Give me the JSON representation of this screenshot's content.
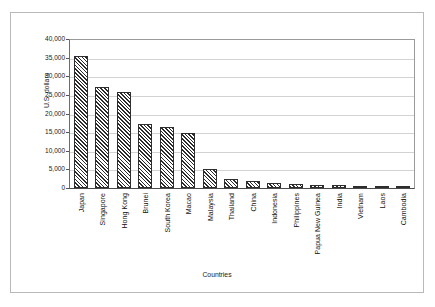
{
  "chart_data": {
    "type": "bar",
    "title": "",
    "xlabel": "Countries",
    "ylabel": "U.S. dollars",
    "ylim": [
      0,
      40000
    ],
    "ytick_labels": [
      "40,000",
      "35,000",
      "30,000",
      "25,000",
      "20,000",
      "15,000",
      "10,000",
      "5,000",
      "0"
    ],
    "ytick_values": [
      40000,
      35000,
      30000,
      25000,
      20000,
      15000,
      10000,
      5000,
      0
    ],
    "grid": true,
    "legend": "none",
    "categories": [
      "Japan",
      "Singapore",
      "Hong Kong",
      "Brunei",
      "South Korea",
      "Macao",
      "Malaysia",
      "Thailand",
      "China",
      "Indonesia",
      "Philippines",
      "Papua New Guinea",
      "India",
      "Vietnam",
      "Laos",
      "Cambodia"
    ],
    "values": [
      35500,
      27000,
      25800,
      17200,
      16500,
      14800,
      5100,
      2500,
      1900,
      1300,
      1100,
      900,
      800,
      600,
      450,
      400
    ],
    "bar_fill": "diagonal-hatch",
    "bar_edge_color": "#2e2e2e",
    "grid_color": "#d2d2d2",
    "axis_color": "#4a4a4a"
  }
}
